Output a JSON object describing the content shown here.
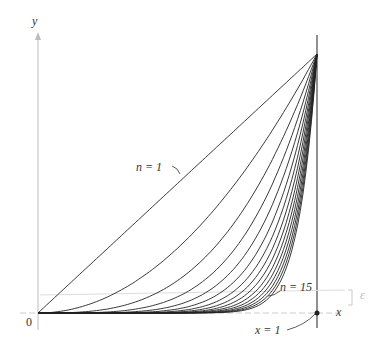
{
  "chart_data": {
    "type": "line",
    "title": "",
    "xlabel": "x",
    "ylabel": "y",
    "n_values": [
      1,
      2,
      3,
      4,
      5,
      6,
      7,
      8,
      9,
      10,
      11,
      12,
      13,
      14,
      15
    ],
    "x_range": [
      0,
      1
    ],
    "y_range": [
      0,
      1
    ],
    "grid": false,
    "annotations": [
      {
        "text": "n = 1",
        "target": "curve n=1"
      },
      {
        "text": "n = 15",
        "target": "curve n=15"
      },
      {
        "text": "x = 1",
        "target": "point (1,0)"
      },
      {
        "text": "0",
        "target": "origin"
      }
    ]
  },
  "labels": {
    "y_axis": "y",
    "x_axis": "x",
    "origin": "0",
    "n1": "n = 1",
    "n15": "n = 15",
    "x1": "x = 1"
  }
}
